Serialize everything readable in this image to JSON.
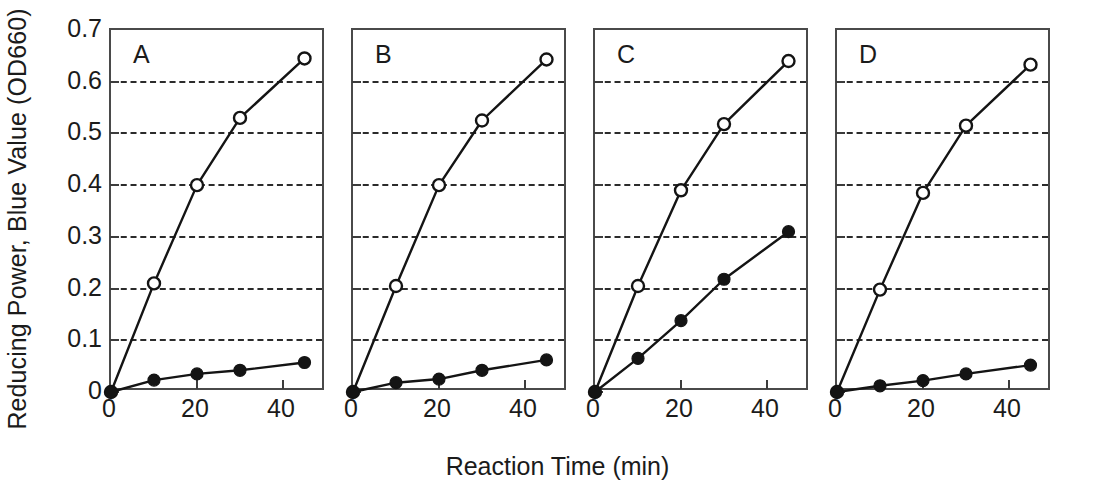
{
  "figure": {
    "ylabel": "Reducing Power, Blue Value (OD660)",
    "xlabel": "Reaction Time (min)",
    "yticks": [
      "0",
      "0.1",
      "0.2",
      "0.3",
      "0.4",
      "0.5",
      "0.6",
      "0.7"
    ],
    "xticks": [
      "0",
      "20",
      "40"
    ]
  },
  "chart_data": {
    "type": "line",
    "title": "",
    "xlabel": "Reaction Time (min)",
    "ylabel": "Reducing Power, Blue Value (OD660)",
    "xlim": [
      0,
      50
    ],
    "ylim": [
      0,
      0.7
    ],
    "xticks": [
      0,
      20,
      40
    ],
    "yticks": [
      0,
      0.1,
      0.2,
      0.3,
      0.4,
      0.5,
      0.6,
      0.7
    ],
    "grid": "horizontal-dashed",
    "legend": "none",
    "panels": [
      {
        "label": "A",
        "x": [
          0,
          10,
          20,
          30,
          45
        ],
        "series": [
          {
            "name": "open-circle",
            "marker": "open-circle",
            "values": [
              0,
              0.21,
              0.4,
              0.53,
              0.645
            ]
          },
          {
            "name": "filled-circle",
            "marker": "filled-circle",
            "values": [
              0,
              0.023,
              0.035,
              0.042,
              0.057
            ]
          }
        ]
      },
      {
        "label": "B",
        "x": [
          0,
          10,
          20,
          30,
          45
        ],
        "series": [
          {
            "name": "open-circle",
            "marker": "open-circle",
            "values": [
              0,
              0.205,
              0.4,
              0.525,
              0.643
            ]
          },
          {
            "name": "filled-circle",
            "marker": "filled-circle",
            "values": [
              0,
              0.018,
              0.025,
              0.042,
              0.062
            ]
          }
        ]
      },
      {
        "label": "C",
        "x": [
          0,
          10,
          20,
          30,
          45
        ],
        "series": [
          {
            "name": "open-circle",
            "marker": "open-circle",
            "values": [
              0,
              0.205,
              0.39,
              0.518,
              0.64
            ]
          },
          {
            "name": "filled-circle",
            "marker": "filled-circle",
            "values": [
              0,
              0.065,
              0.138,
              0.218,
              0.31
            ]
          }
        ]
      },
      {
        "label": "D",
        "x": [
          0,
          10,
          20,
          30,
          45
        ],
        "series": [
          {
            "name": "open-circle",
            "marker": "open-circle",
            "values": [
              0,
              0.198,
              0.385,
              0.515,
              0.633
            ]
          },
          {
            "name": "filled-circle",
            "marker": "filled-circle",
            "values": [
              0,
              0.012,
              0.022,
              0.035,
              0.052
            ]
          }
        ]
      }
    ]
  }
}
